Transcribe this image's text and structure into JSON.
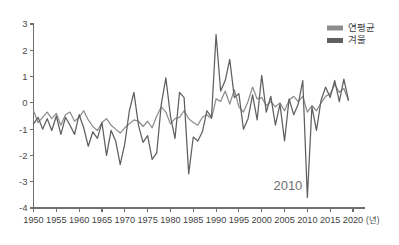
{
  "chart_data": {
    "type": "line",
    "title": "",
    "subtitle": "",
    "xlabel": "(년)",
    "ylabel": "",
    "xlim": [
      1950,
      2020
    ],
    "ylim": [
      -4,
      3
    ],
    "grid": false,
    "legend_position": "top-right",
    "xticks": [
      1950,
      1955,
      1960,
      1965,
      1970,
      1975,
      1980,
      1985,
      1990,
      1995,
      2000,
      2005,
      2010,
      2015,
      2020
    ],
    "yticks": [
      3,
      2,
      1,
      0,
      -1,
      -2,
      -3,
      -4
    ],
    "x": [
      1950,
      1951,
      1952,
      1953,
      1954,
      1955,
      1956,
      1957,
      1958,
      1959,
      1960,
      1961,
      1962,
      1963,
      1964,
      1965,
      1966,
      1967,
      1968,
      1969,
      1970,
      1971,
      1972,
      1973,
      1974,
      1975,
      1976,
      1977,
      1978,
      1979,
      1980,
      1981,
      1982,
      1983,
      1984,
      1985,
      1986,
      1987,
      1988,
      1989,
      1990,
      1991,
      1992,
      1993,
      1994,
      1995,
      1996,
      1997,
      1998,
      1999,
      2000,
      2001,
      2002,
      2003,
      2004,
      2005,
      2006,
      2007,
      2008,
      2009,
      2010,
      2011,
      2012,
      2013,
      2014,
      2015,
      2016,
      2017,
      2018,
      2019
    ],
    "series": [
      {
        "name": "연평균",
        "color": "#8c8c8c",
        "values": [
          -0.3,
          -0.75,
          -0.55,
          -0.35,
          -0.6,
          -0.4,
          -0.85,
          -0.45,
          -0.35,
          -0.7,
          -0.55,
          -0.3,
          -0.65,
          -0.9,
          -1.05,
          -0.75,
          -0.6,
          -0.85,
          -1.0,
          -1.15,
          -0.95,
          -0.8,
          -0.65,
          -0.7,
          -0.9,
          -0.7,
          -0.95,
          -0.5,
          -0.15,
          -0.35,
          -0.8,
          -0.6,
          -0.55,
          -0.3,
          -0.6,
          -0.75,
          -0.85,
          -0.55,
          -0.45,
          -0.6,
          0.15,
          0.05,
          0.45,
          -0.05,
          0.5,
          -0.15,
          -0.35,
          0.05,
          0.6,
          0.15,
          0.2,
          -0.1,
          0.05,
          -0.15,
          0.0,
          -0.3,
          0.1,
          0.25,
          0.05,
          0.25,
          -0.35,
          -0.1,
          -0.3,
          0.0,
          0.25,
          0.35,
          0.7,
          0.4,
          0.55,
          0.1
        ]
      },
      {
        "name": "겨울",
        "color": "#5f5f5f",
        "values": [
          -0.8,
          -0.55,
          -1.0,
          -0.6,
          -1.05,
          -0.5,
          -1.2,
          -0.55,
          -0.85,
          -1.2,
          -0.45,
          -0.95,
          -1.65,
          -1.1,
          -1.35,
          -0.75,
          -2.0,
          -1.05,
          -1.45,
          -2.35,
          -1.55,
          -0.3,
          0.4,
          -0.85,
          -1.5,
          -1.25,
          -2.15,
          -1.9,
          -0.05,
          0.95,
          -0.5,
          -1.35,
          0.4,
          0.2,
          -2.7,
          -1.3,
          -1.45,
          -1.1,
          -0.3,
          -0.55,
          2.6,
          0.45,
          0.85,
          1.65,
          0.2,
          0.35,
          -1.0,
          -0.6,
          0.3,
          -0.65,
          1.05,
          -0.35,
          0.25,
          -0.85,
          -0.05,
          -1.45,
          0.15,
          -0.45,
          -0.05,
          0.85,
          -3.6,
          -0.15,
          -1.05,
          0.1,
          0.6,
          0.2,
          0.85,
          0.05,
          0.9,
          0.1
        ]
      }
    ],
    "annotations": [
      {
        "text": "2010",
        "x": 2010,
        "y": -3.3
      }
    ]
  },
  "legend": {
    "items": [
      {
        "label": "연평균",
        "color": "#8c8c8c"
      },
      {
        "label": "겨울",
        "color": "#5f5f5f"
      }
    ]
  },
  "axis": {
    "x_unit_label": "(년)"
  }
}
